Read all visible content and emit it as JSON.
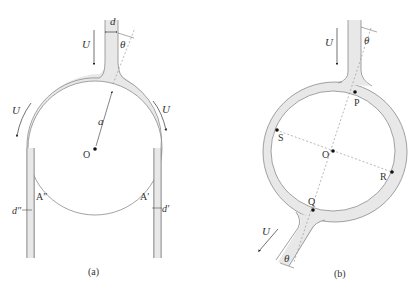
{
  "figure": {
    "panels": [
      {
        "id": "a",
        "caption": "(a)",
        "labels": {
          "jet_width": "d",
          "angle": "θ",
          "velocity_top": "U",
          "velocity_left": "U",
          "velocity_right": "U",
          "radius": "a",
          "center": "O",
          "point_left": "A″",
          "point_right": "A′",
          "thickness_left": "d″",
          "thickness_right": "d′"
        }
      },
      {
        "id": "b",
        "caption": "(b)",
        "labels": {
          "velocity_top": "U",
          "angle_top": "θ",
          "point_p": "P",
          "point_s": "S",
          "center": "O",
          "point_r": "R",
          "point_q": "Q",
          "velocity_bottom": "U",
          "angle_bottom": "θ"
        }
      }
    ],
    "colors": {
      "fluid_fill": "#e6e6e6",
      "stroke": "#8a8a8a",
      "dash": "#9a9a9a",
      "dot": "#111111",
      "text": "#333333"
    }
  }
}
